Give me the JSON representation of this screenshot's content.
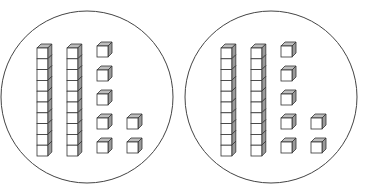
{
  "figure": {
    "groups": [
      {
        "name": "left-circle",
        "cx": 87,
        "cy": 97,
        "r": 86,
        "tens_rods": 2,
        "unit_cubes": 7,
        "value": 27
      },
      {
        "name": "right-circle",
        "cx": 271,
        "cy": 97,
        "r": 86,
        "tens_rods": 2,
        "unit_cubes": 7,
        "value": 27
      }
    ],
    "colors": {
      "stroke": "#333333",
      "face": "#ffffff",
      "top": "#bdbdbd",
      "side": "#9a9a9a",
      "circle": "#444444"
    }
  }
}
